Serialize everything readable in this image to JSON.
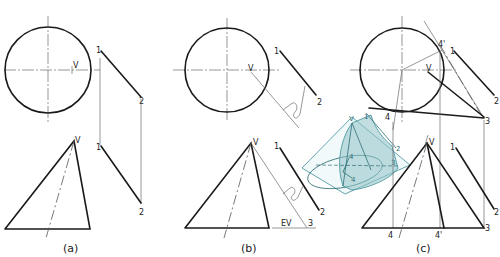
{
  "figure": {
    "line_color": "#1a1a1a",
    "construction_color": "#6a6a6a",
    "pictorial_color": "#3e8f97",
    "pictorial_fill": "#8fc3c9"
  },
  "panels": [
    {
      "caption": "(a)",
      "labels": {
        "apex_top": "V",
        "apex_front": "V",
        "p1_top": "1",
        "p2_top": "2",
        "p1_front": "1",
        "p2_front": "2"
      }
    },
    {
      "caption": "(b)",
      "labels": {
        "apex_top": "V",
        "apex_front": "V",
        "p1_top": "1",
        "p2_top": "2",
        "p1_front": "1",
        "p2_front": "2",
        "p3_front": "3",
        "edge_view": "EV"
      }
    },
    {
      "caption": "(c)",
      "labels": {
        "apex_top": "V",
        "apex_front": "V",
        "p1_top": "1",
        "p2_top": "2",
        "p3_top": "3",
        "p4_top": "4",
        "p4p_top": "4'",
        "p1_front": "1",
        "p2_front": "2",
        "p3_front": "3",
        "p4_front": "4",
        "p4p_front": "4'"
      }
    }
  ],
  "pictorial": {
    "labels": {
      "apex": "V",
      "p1": "1",
      "p2": "2",
      "p3": "3",
      "p4": "4",
      "p4b": "4"
    }
  }
}
